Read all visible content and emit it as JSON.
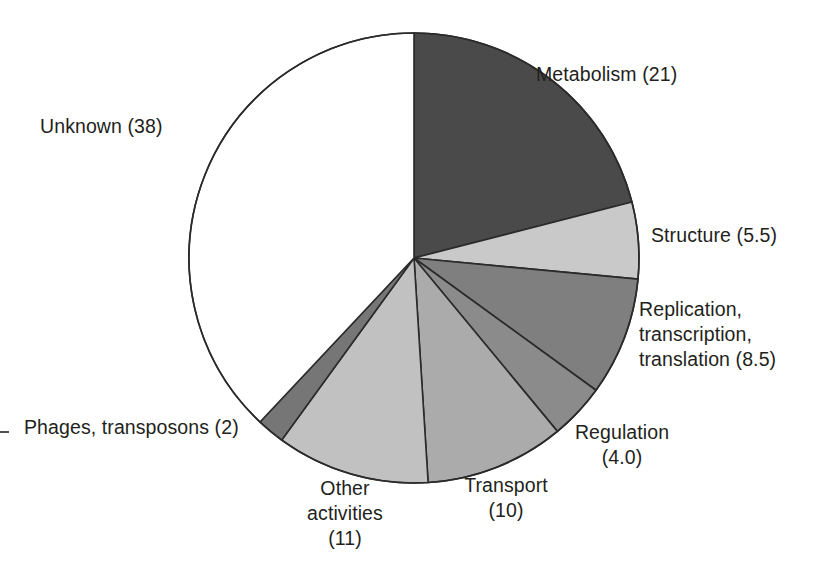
{
  "chart_data": {
    "type": "pie",
    "title": "",
    "subtitle": "",
    "xlabel": "",
    "ylabel": "",
    "legend_position": "none",
    "grid": false,
    "units": "percent",
    "total": 100,
    "start_angle_deg": 0,
    "direction": "clockwise",
    "categories": [
      "Metabolism",
      "Structure",
      "Replication, transcription, translation",
      "Regulation",
      "Transport",
      "Other activities",
      "Phages, transposons",
      "Unknown"
    ],
    "values": [
      21,
      5.5,
      8.5,
      4.0,
      10,
      11,
      2,
      38
    ],
    "slices": [
      {
        "key": "metabolism",
        "name": "Metabolism",
        "value": 21,
        "value_text": "21",
        "label": "Metabolism (21)",
        "label_lines": [
          "Metabolism (21)"
        ],
        "color": "#4a4a4a"
      },
      {
        "key": "structure",
        "name": "Structure",
        "value": 5.5,
        "value_text": "5.5",
        "label": "Structure (5.5)",
        "label_lines": [
          "Structure (5.5)"
        ],
        "color": "#c9c9c9"
      },
      {
        "key": "replication",
        "name": "Replication, transcription, translation",
        "value": 8.5,
        "value_text": "8.5",
        "label": "Replication, transcription, translation (8.5)",
        "label_lines": [
          "Replication,",
          "transcription,",
          "translation (8.5)"
        ],
        "color": "#7f7f7f"
      },
      {
        "key": "regulation",
        "name": "Regulation",
        "value": 4.0,
        "value_text": "4.0",
        "label": "Regulation (4.0)",
        "label_lines": [
          "Regulation",
          "(4.0)"
        ],
        "color": "#8b8b8b"
      },
      {
        "key": "transport",
        "name": "Transport",
        "value": 10,
        "value_text": "10",
        "label": "Transport (10)",
        "label_lines": [
          "Transport",
          "(10)"
        ],
        "color": "#ababab"
      },
      {
        "key": "other_activities",
        "name": "Other activities",
        "value": 11,
        "value_text": "11",
        "label": "Other activities (11)",
        "label_lines": [
          "Other",
          "activities",
          "(11)"
        ],
        "color": "#c1c1c1"
      },
      {
        "key": "phages_transposons",
        "name": "Phages, transposons",
        "value": 2,
        "value_text": "2",
        "label": "Phages, transposons (2)",
        "label_lines": [
          "Phages, transposons (2)"
        ],
        "color": "#767676"
      },
      {
        "key": "unknown",
        "name": "Unknown",
        "value": 38,
        "value_text": "38",
        "label": "Unknown (38)",
        "label_lines": [
          "Unknown (38)"
        ],
        "color": "#ffffff"
      }
    ],
    "geometry": {
      "center_x": 414,
      "center_y": 258,
      "radius": 225,
      "outline_color": "#2b2b2b",
      "outline_width": 1.6
    }
  }
}
